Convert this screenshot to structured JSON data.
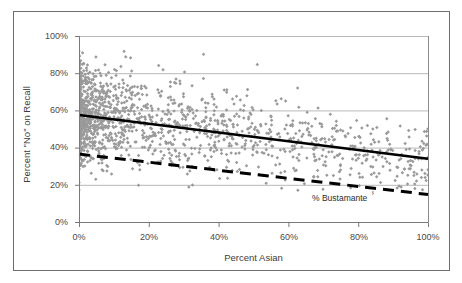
{
  "figure": {
    "background_color": "#ffffff",
    "frame_color": "#6e6e6e"
  },
  "annotation": {
    "label": "% Bustamante",
    "arrow_glyph": "ⸯ"
  },
  "chart_data": {
    "type": "scatter",
    "title": "",
    "subtitle": "",
    "xlabel": "Percent Asian",
    "ylabel": "Percent \"No\" on Recall",
    "xlim": [
      0,
      100
    ],
    "ylim": [
      0,
      100
    ],
    "x_ticks": [
      0,
      20,
      40,
      60,
      80,
      100
    ],
    "y_ticks": [
      0,
      20,
      40,
      60,
      80,
      100
    ],
    "x_tick_labels": [
      "0%",
      "20%",
      "40%",
      "60%",
      "80%",
      "100%"
    ],
    "y_tick_labels": [
      "0%",
      "20%",
      "40%",
      "60%",
      "80%",
      "100%"
    ],
    "grid": "horizontal",
    "grid_color": "#b8b8b8",
    "legend": "none",
    "marker": {
      "shape": "diamond",
      "color": "#9a9a9a",
      "size": 3
    },
    "series": [
      {
        "name": "Precincts",
        "type": "scatter",
        "marker_color": "#9a9a9a",
        "point_count": 1650,
        "note": "Dense cluster of precinct observations; highest density below 15% Asian, spread 20%-90% on recall; thins out and drifts downward as Percent Asian increases."
      },
      {
        "name": "Percent \"No\" on Recall trend",
        "type": "line",
        "style": "solid",
        "color": "#000000",
        "width": 2.6,
        "x": [
          0,
          100
        ],
        "y": [
          57.5,
          34.0
        ]
      },
      {
        "name": "% Bustamante trend",
        "type": "line",
        "style": "dashed",
        "color": "#000000",
        "width": 3.0,
        "dash_pattern": "11 7",
        "x": [
          0,
          100
        ],
        "y": [
          36.5,
          14.8
        ]
      }
    ]
  }
}
